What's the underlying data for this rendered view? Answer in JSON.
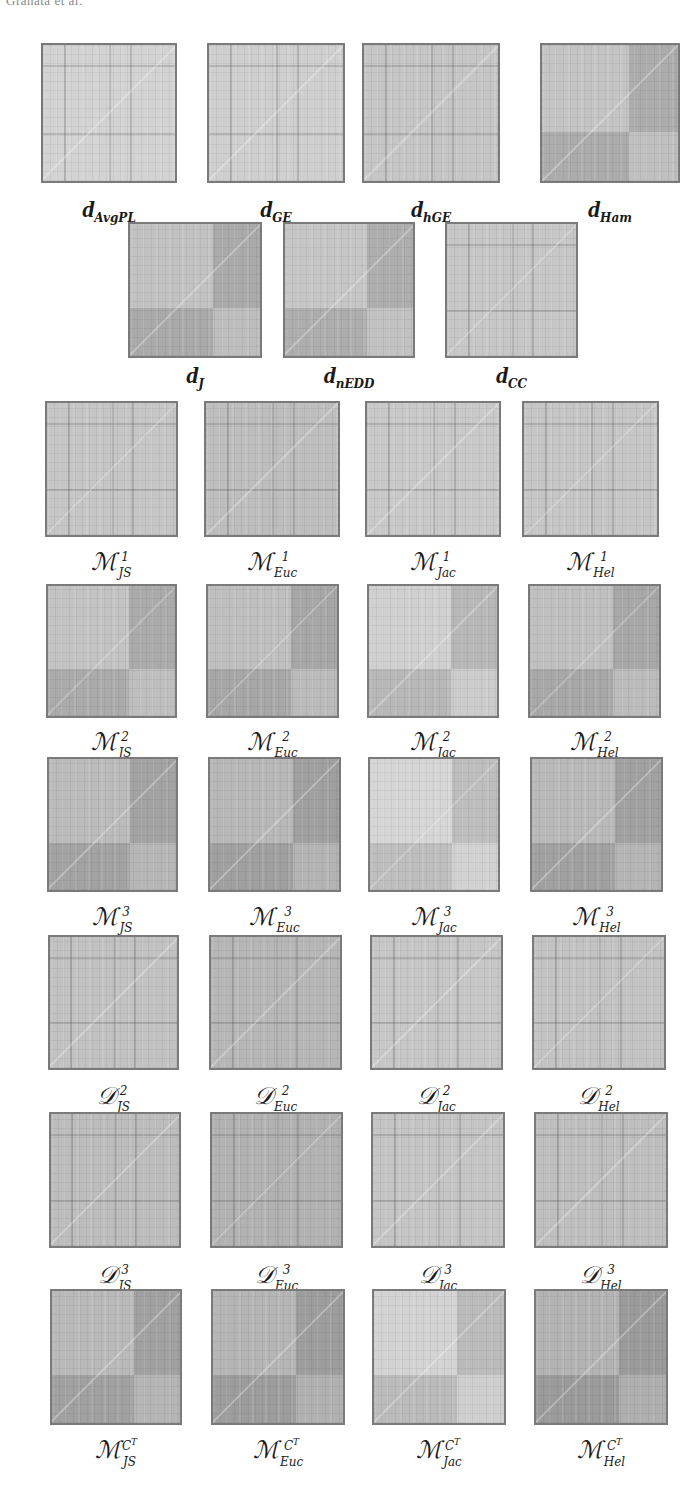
{
  "header": {
    "running_head": "Granata et al."
  },
  "figure": {
    "rows": [
      {
        "group": "network distances",
        "items": [
          {
            "base": "d",
            "sub": "AvgPL",
            "sup": "",
            "tone": "#d3d3d3",
            "blocks": false
          },
          {
            "base": "d",
            "sub": "GE",
            "sup": "",
            "tone": "#cfcfcf",
            "blocks": false
          },
          {
            "base": "d",
            "sub": "hGE",
            "sup": "",
            "tone": "#c6c6c6",
            "blocks": false
          },
          {
            "base": "d",
            "sub": "Ham",
            "sup": "",
            "tone": "#b4b4b4",
            "blocks": true
          }
        ]
      },
      {
        "group": "network distances (cont.)",
        "items": [
          {
            "base": "d",
            "sub": "J",
            "sup": "",
            "tone": "#b2b2b2",
            "blocks": true
          },
          {
            "base": "d",
            "sub": "nEDD",
            "sup": "",
            "tone": "#b6b6b6",
            "blocks": true
          },
          {
            "base": "d",
            "sub": "CC",
            "sup": "",
            "tone": "#c7c7c7",
            "blocks": false
          }
        ]
      },
      {
        "group": "M1",
        "items": [
          {
            "base": "M",
            "sub": "JS",
            "sup": "1",
            "tone": "#c6c6c6",
            "blocks": false
          },
          {
            "base": "M",
            "sub": "Euc",
            "sup": "1",
            "tone": "#bebebe",
            "blocks": false
          },
          {
            "base": "M",
            "sub": "Jac",
            "sup": "1",
            "tone": "#c9c9c9",
            "blocks": false
          },
          {
            "base": "M",
            "sub": "Hel",
            "sup": "1",
            "tone": "#c6c6c6",
            "blocks": false
          }
        ]
      },
      {
        "group": "M2",
        "items": [
          {
            "base": "M",
            "sub": "JS",
            "sup": "2",
            "tone": "#b3b3b3",
            "blocks": true
          },
          {
            "base": "M",
            "sub": "Euc",
            "sup": "2",
            "tone": "#afafaf",
            "blocks": true
          },
          {
            "base": "M",
            "sub": "Jac",
            "sup": "2",
            "tone": "#c0c0c0",
            "blocks": true
          },
          {
            "base": "M",
            "sub": "Hel",
            "sup": "2",
            "tone": "#b0b0b0",
            "blocks": true
          }
        ]
      },
      {
        "group": "M3",
        "items": [
          {
            "base": "M",
            "sub": "JS",
            "sup": "3",
            "tone": "#ababab",
            "blocks": true
          },
          {
            "base": "M",
            "sub": "Euc",
            "sup": "3",
            "tone": "#a8a8a8",
            "blocks": true
          },
          {
            "base": "M",
            "sub": "Jac",
            "sup": "3",
            "tone": "#c6c6c6",
            "blocks": true
          },
          {
            "base": "M",
            "sub": "Hel",
            "sup": "3",
            "tone": "#a9a9a9",
            "blocks": true
          }
        ]
      },
      {
        "group": "D2",
        "items": [
          {
            "base": "D",
            "sub": "JS",
            "sup": "2",
            "tone": "#c2c2c2",
            "blocks": false
          },
          {
            "base": "D",
            "sub": "Euc",
            "sup": "2",
            "tone": "#b7b7b7",
            "blocks": false
          },
          {
            "base": "D",
            "sub": "Jac",
            "sup": "2",
            "tone": "#c7c7c7",
            "blocks": false
          },
          {
            "base": "D",
            "sub": "Hel",
            "sup": "2",
            "tone": "#c3c3c3",
            "blocks": false
          }
        ]
      },
      {
        "group": "D3",
        "items": [
          {
            "base": "D",
            "sub": "JS",
            "sup": "3",
            "tone": "#bdbdbd",
            "blocks": false
          },
          {
            "base": "D",
            "sub": "Euc",
            "sup": "3",
            "tone": "#b2b2b2",
            "blocks": false
          },
          {
            "base": "D",
            "sub": "Jac",
            "sup": "3",
            "tone": "#c5c5c5",
            "blocks": false
          },
          {
            "base": "D",
            "sub": "Hel",
            "sup": "3",
            "tone": "#bfbfbf",
            "blocks": false
          }
        ]
      },
      {
        "group": "MCT",
        "items": [
          {
            "base": "M",
            "sub": "JS",
            "sup": "C^T",
            "tone": "#a9a9a9",
            "blocks": true
          },
          {
            "base": "M",
            "sub": "Euc",
            "sup": "C^T",
            "tone": "#a5a5a5",
            "blocks": true
          },
          {
            "base": "M",
            "sub": "Jac",
            "sup": "C^T",
            "tone": "#c3c3c3",
            "blocks": true
          },
          {
            "base": "M",
            "sub": "Hel",
            "sup": "C^T",
            "tone": "#a3a3a3",
            "blocks": true
          }
        ]
      }
    ]
  },
  "labels": {
    "r0": [
      "d_AvgPL",
      "d_GE",
      "d_hGE",
      "d_Ham"
    ],
    "r1": [
      "d_J",
      "d_nEDD",
      "d_CC"
    ],
    "r2": [
      "M^1_JS",
      "M^1_Euc",
      "M^1_Jac",
      "M^1_Hel"
    ],
    "r3": [
      "M^2_JS",
      "M^2_Euc",
      "M^2_Jac",
      "M^2_Hel"
    ],
    "r4": [
      "M^3_JS",
      "M^3_Euc",
      "M^3_Jac",
      "M^3_Hel"
    ],
    "r5": [
      "D^2_JS",
      "D^2_Euc",
      "D^2_Jac",
      "D^2_Hel"
    ],
    "r6": [
      "D^3_JS",
      "D^3_Euc",
      "D^3_Jac",
      "D^3_Hel"
    ],
    "r7": [
      "M^{C^T}_JS",
      "M^{C^T}_Euc",
      "M^{C^T}_Jac",
      "M^{C^T}_Hel"
    ]
  }
}
